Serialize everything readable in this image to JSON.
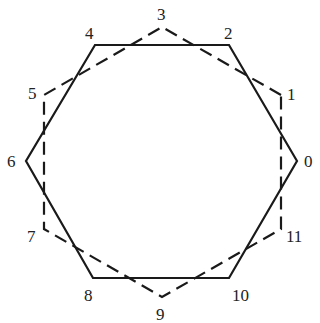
{
  "diagram": {
    "colors": {
      "stroke": "#1a1a1a",
      "label": "#222222",
      "background": "#ffffff"
    },
    "solid_hexagon": {
      "style": "solid",
      "vertices": [
        0,
        2,
        4,
        6,
        8,
        10
      ]
    },
    "dashed_hexagon": {
      "style": "dashed",
      "vertices": [
        1,
        3,
        5,
        7,
        9,
        11
      ]
    },
    "points": [
      {
        "label": "0",
        "x": 297,
        "y": 161,
        "lx": 304,
        "ly": 167
      },
      {
        "label": "1",
        "x": 281,
        "y": 95,
        "lx": 287,
        "ly": 100
      },
      {
        "label": "2",
        "x": 229,
        "y": 45,
        "lx": 224,
        "ly": 39
      },
      {
        "label": "3",
        "x": 162,
        "y": 27,
        "lx": 157,
        "ly": 20
      },
      {
        "label": "4",
        "x": 95,
        "y": 45,
        "lx": 85,
        "ly": 39
      },
      {
        "label": "5",
        "x": 44,
        "y": 95,
        "lx": 28,
        "ly": 99
      },
      {
        "label": "6",
        "x": 26,
        "y": 161,
        "lx": 7,
        "ly": 167
      },
      {
        "label": "7",
        "x": 44,
        "y": 229,
        "lx": 27,
        "ly": 242
      },
      {
        "label": "8",
        "x": 93,
        "y": 278,
        "lx": 84,
        "ly": 301
      },
      {
        "label": "9",
        "x": 162,
        "y": 297,
        "lx": 156,
        "ly": 320
      },
      {
        "label": "10",
        "x": 229,
        "y": 278,
        "lx": 232,
        "ly": 301
      },
      {
        "label": "11",
        "x": 281,
        "y": 229,
        "lx": 286,
        "ly": 242
      }
    ]
  }
}
